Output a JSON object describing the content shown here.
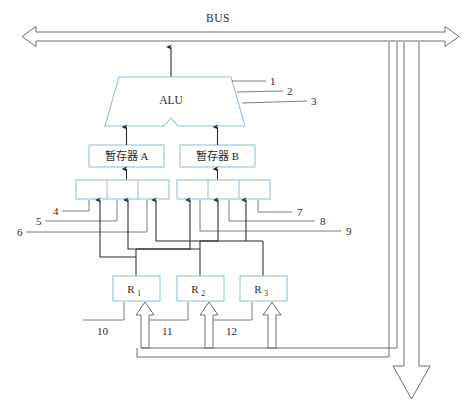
{
  "figure": {
    "title_text": "BUS",
    "background": "#ffffff",
    "box_stroke": "#93c4de",
    "wire_stroke": "#6e6e6e",
    "text_color": "#2b2b2b",
    "width": 464,
    "height": 406
  },
  "bus": {
    "label": "BUS",
    "name": "system-bus"
  },
  "alu": {
    "label": "ALU"
  },
  "temp_registers": [
    {
      "label": "暂存器 A",
      "name": "temp-register-a"
    },
    {
      "label": "暂存器 B",
      "name": "temp-register-b"
    }
  ],
  "multiplexers": [
    {
      "name": "mux-a",
      "cells": 3
    },
    {
      "name": "mux-b",
      "cells": 3
    }
  ],
  "registers": [
    {
      "label": "R",
      "sub": "1",
      "name": "register-r1"
    },
    {
      "label": "R",
      "sub": "2",
      "name": "register-r2"
    },
    {
      "label": "R",
      "sub": "3",
      "name": "register-r3"
    }
  ],
  "callouts": [
    {
      "id": "1",
      "label": "1",
      "x": 270,
      "y": 85
    },
    {
      "id": "2",
      "label": "2",
      "x": 287,
      "y": 95
    },
    {
      "id": "3",
      "label": "3",
      "x": 311,
      "y": 105
    },
    {
      "id": "4",
      "label": "4",
      "x": 53,
      "y": 211
    },
    {
      "id": "5",
      "label": "5",
      "x": 36,
      "y": 221
    },
    {
      "id": "6",
      "label": "6",
      "x": 17,
      "y": 232
    },
    {
      "id": "7",
      "label": "7",
      "x": 297,
      "y": 212
    },
    {
      "id": "8",
      "label": "8",
      "x": 320,
      "y": 221
    },
    {
      "id": "9",
      "label": "9",
      "x": 346,
      "y": 231
    },
    {
      "id": "10",
      "label": "10",
      "x": 97,
      "y": 331
    },
    {
      "id": "11",
      "label": "11",
      "x": 162,
      "y": 331
    },
    {
      "id": "12",
      "label": "12",
      "x": 226,
      "y": 331
    }
  ]
}
